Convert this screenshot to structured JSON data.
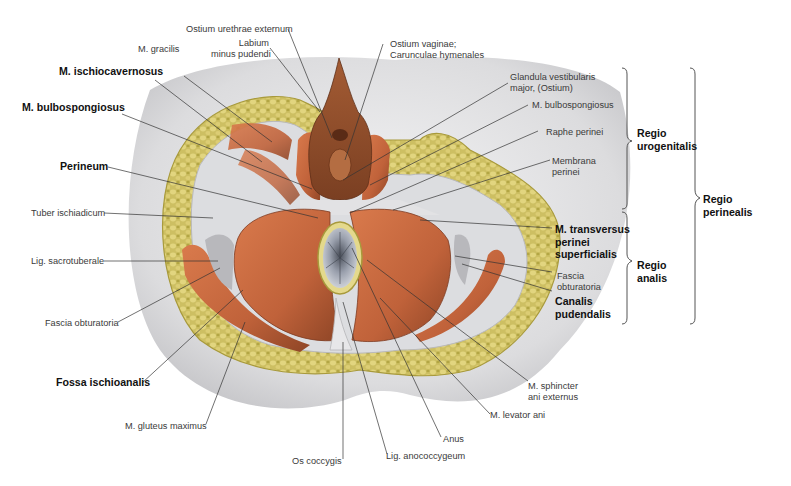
{
  "figure": {
    "type": "anatomical illustration",
    "view": "female perineum, inferior view"
  },
  "labels_left": [
    {
      "id": "m-gracilis",
      "text": "M. gracilis",
      "bold": false
    },
    {
      "id": "m-ischiocavernosus",
      "text": "M. ischiocavernosus",
      "bold": true
    },
    {
      "id": "m-bulbospongiosus-left",
      "text": "M. bulbospongiosus",
      "bold": true
    },
    {
      "id": "perineum",
      "text": "Perineum",
      "bold": true
    },
    {
      "id": "tuber-ischiadicum",
      "text": "Tuber ischiadicum",
      "bold": false
    },
    {
      "id": "lig-sacrotuberale",
      "text": "Lig. sacrotuberale",
      "bold": false
    },
    {
      "id": "fascia-obturatoria-left",
      "text": "Fascia obturatoria",
      "bold": false
    },
    {
      "id": "fossa-ischioanalis",
      "text": "Fossa ischioanalis",
      "bold": true
    },
    {
      "id": "m-gluteus-maximus",
      "text": "M. gluteus maximus",
      "bold": false
    }
  ],
  "labels_top": [
    {
      "id": "ostium-urethrae",
      "text": "Ostium urethrae externum"
    },
    {
      "id": "labium-minus",
      "text": "Labium\nminus pudendi"
    },
    {
      "id": "ostium-vaginae",
      "text": "Ostium vaginae;\nCarunculae hymenales"
    }
  ],
  "labels_right": [
    {
      "id": "glandula-vestibularis",
      "text": "Glandula vestibularis\nmajor, (Ostium)",
      "bold": false
    },
    {
      "id": "m-bulbospongiosus-right",
      "text": "M. bulbospongiosus",
      "bold": false
    },
    {
      "id": "raphe-perinei",
      "text": "Raphe perinei",
      "bold": false
    },
    {
      "id": "membrana-perinei",
      "text": "Membrana\nperinei",
      "bold": false
    },
    {
      "id": "m-transversus",
      "text": "M. transversus\nperinei\nsuperficialis",
      "bold": true
    },
    {
      "id": "fascia-obturatoria-right",
      "text": "Fascia\nobturatoria",
      "bold": false
    },
    {
      "id": "canalis-pudendalis",
      "text": "Canalis\npudendalis",
      "bold": true
    }
  ],
  "labels_bottom": [
    {
      "id": "m-sphincter-ani",
      "text": "M. sphincter\nani externus"
    },
    {
      "id": "m-levator-ani",
      "text": "M. levator ani"
    },
    {
      "id": "anus",
      "text": "Anus"
    },
    {
      "id": "lig-anococcygeum",
      "text": "Lig. anococcygeum"
    },
    {
      "id": "os-coccygis",
      "text": "Os coccygis"
    }
  ],
  "regions": [
    {
      "id": "regio-urogenitalis",
      "text": "Regio\nurogenitalis"
    },
    {
      "id": "regio-analis",
      "text": "Regio\nanalis"
    },
    {
      "id": "regio-perinealis",
      "text": "Regio\nperinealis"
    }
  ],
  "colors": {
    "muscle": "#c8693f",
    "muscle_dark": "#9c4a28",
    "fat": "#cfc067",
    "fat_dark": "#a89a3c",
    "skin": "#e9e9ea",
    "fascia": "#d9d9dc",
    "leader": "#333333"
  }
}
